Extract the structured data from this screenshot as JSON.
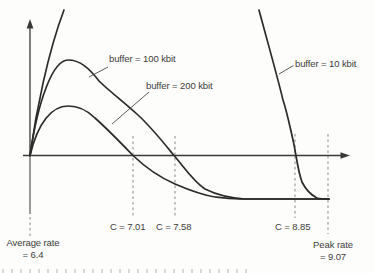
{
  "figure": {
    "labels": {
      "buffer_100": "buffer = 100 kbit",
      "buffer_200": "buffer = 200 kbit",
      "buffer_10": "buffer = 10 kbit",
      "c_200": "C = 7.01",
      "c_100": "C = 7.58",
      "c_10": "C = 8.85",
      "average_rate_line1": "Average rate",
      "average_rate_line2": "= 6.4",
      "peak_rate_line1": "Peak rate",
      "peak_rate_line2": "= 9.07"
    }
  },
  "chart_data": {
    "type": "line",
    "title": "",
    "xlabel": "",
    "ylabel": "",
    "grid": false,
    "legend": "inline-labels-with-leader-lines",
    "x_markers": [
      {
        "label": "Average rate",
        "value": 6.4,
        "style": "dashed-vertical-below-axis"
      },
      {
        "label": "C",
        "value": 7.01,
        "series": "buffer = 200 kbit",
        "style": "dashed-vertical"
      },
      {
        "label": "C",
        "value": 7.58,
        "series": "buffer = 100 kbit",
        "style": "dashed-vertical"
      },
      {
        "label": "C",
        "value": 8.85,
        "series": "buffer = 10 kbit",
        "style": "dashed-vertical"
      },
      {
        "label": "Peak rate",
        "value": 9.07,
        "style": "dashed-vertical"
      }
    ],
    "series": [
      {
        "name": "buffer = 10 kbit",
        "x_axis_crossing_C": 8.85,
        "shape": "rises off top of plot near origin, re-enters steeply on right, crosses axis at C = 8.85, flattens to asymptote near peak rate"
      },
      {
        "name": "buffer = 100 kbit",
        "x_axis_crossing_C": 7.58,
        "shape": "peaks high left of center, decays, crosses axis at C = 7.58, flattens to asymptote"
      },
      {
        "name": "buffer = 200 kbit",
        "x_axis_crossing_C": 7.01,
        "shape": "lower peak left of center, decays, crosses axis at C = 7.01, flattens to asymptote"
      }
    ],
    "axis_range_notes": {
      "x_left_value": 6.4,
      "x_right_value": 9.07,
      "y_axis_label": "",
      "x_axis_label": ""
    },
    "colors": {
      "curve": "#2b2b2b",
      "dashed_marker": "#9b9b9b",
      "text": "#3c3c3c",
      "axis": "#3a3a3a",
      "background": "#fdfdfb"
    },
    "render_paths_px": [
      {
        "name": "x-axis-line",
        "cls": "axis",
        "d": "M23,155.5 L341,155.5"
      },
      {
        "name": "y-axis-line",
        "cls": "axis",
        "d": "M30,155.5 L30,27"
      },
      {
        "name": "average-rate-marker-solid",
        "cls": "marker-solid",
        "d": "M30,155.5 L30,214"
      },
      {
        "name": "average-rate-marker-dashed",
        "cls": "dashed",
        "d": "M30,217 L30,236"
      },
      {
        "name": "c-7-01-marker",
        "cls": "dashed",
        "d": "M133,136 L133,216"
      },
      {
        "name": "c-7-58-marker",
        "cls": "dashed",
        "d": "M175,136 L175,216"
      },
      {
        "name": "c-8-85-marker",
        "cls": "dashed",
        "d": "M295,134 L295,218"
      },
      {
        "name": "peak-rate-marker",
        "cls": "dashed",
        "d": "M328,134 L328,234"
      },
      {
        "name": "curve-buffer-10-rising",
        "cls": "curve",
        "d": "M30,155.5 C36,112 48,52 64,10"
      },
      {
        "name": "curve-buffer-10-falling",
        "cls": "curve",
        "d": "M259,10 C267,40 277,75 283,100 C287,112 290,127 293,140 C295.5,150 297.5,170 302,182 C306,190 311,195 317,198 C319,198.5 322,199 329,199"
      },
      {
        "name": "curve-buffer-100",
        "cls": "curve",
        "d": "M30,155.5 C38,100 53,60 68,60 C80,60 89,68 99,81 C108,90 125,103 138,115 C152,128 163,142 174,155.5 C184,167 193,181 205,189 C217,195 230,198 245,199 L329,199"
      },
      {
        "name": "curve-buffer-200",
        "cls": "curve",
        "d": "M30,155.5 C38,122 52,106 68,106 C79,106 88,111 95,118 C104,126 120,142 133,155.5 C146,168 159,177 175,184 C189,190 202,195 215,197 C222,198 228,199 240,199 L329,199"
      },
      {
        "name": "leader-buffer-100",
        "cls": "leader",
        "d": "M108,67 L89,77"
      },
      {
        "name": "leader-buffer-200",
        "cls": "leader",
        "d": "M149,92 L112,124"
      },
      {
        "name": "leader-buffer-10",
        "cls": "leader",
        "d": "M293.5,65.5 L279,74"
      }
    ]
  }
}
